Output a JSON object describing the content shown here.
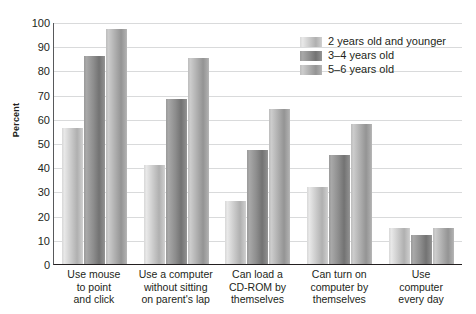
{
  "chart_data": {
    "type": "bar",
    "title": "",
    "xlabel": "",
    "ylabel": "Percent",
    "ylim": [
      0,
      100
    ],
    "ytick_step": 10,
    "yticks": [
      100,
      90,
      80,
      70,
      60,
      50,
      40,
      30,
      20,
      10,
      0
    ],
    "grid": true,
    "legend_position": "top-right inside plot area",
    "categories": [
      "Use mouse to point and click",
      "Use a computer without sitting on parent's lap",
      "Can load a CD-ROM by themselves",
      "Can turn on computer by themselves",
      "Use computer every day"
    ],
    "category_lines": [
      [
        "Use mouse",
        "to point",
        "and click"
      ],
      [
        "Use a computer",
        "without sitting",
        "on parent's lap"
      ],
      [
        "Can load a",
        "CD-ROM by",
        "themselves"
      ],
      [
        "Can turn on",
        "computer by",
        "themselves"
      ],
      [
        "Use",
        "computer",
        "every day"
      ]
    ],
    "series": [
      {
        "name": "2 years old and younger",
        "color": "#c9c9c9",
        "values": [
          56,
          41,
          26,
          32,
          15
        ]
      },
      {
        "name": "3–4 years old",
        "color": "#8d8d8d",
        "values": [
          86,
          68,
          47,
          45,
          12
        ]
      },
      {
        "name": "5–6 years old",
        "color": "#adadad",
        "values": [
          97,
          85,
          64,
          58,
          15
        ]
      }
    ]
  }
}
